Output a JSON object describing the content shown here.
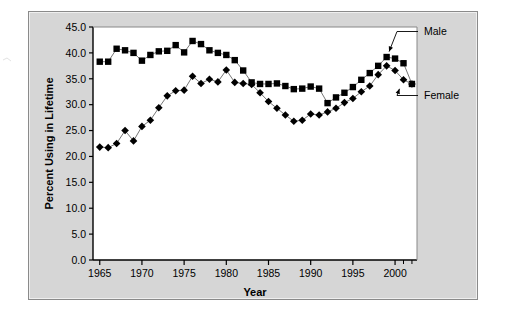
{
  "chart_data": {
    "type": "line",
    "title": "",
    "subtitle": "",
    "xlabel": "Year",
    "ylabel": "Percent Using in Lifetime",
    "xlim": [
      1964.2,
      2002.6
    ],
    "ylim": [
      0.0,
      45.0
    ],
    "yticks": [
      0.0,
      5.0,
      10.0,
      15.0,
      20.0,
      25.0,
      30.0,
      35.0,
      40.0,
      45.0
    ],
    "ytick_labels": [
      "0.0",
      "5.0",
      "10.0",
      "15.0",
      "20.0",
      "25.0",
      "30.0",
      "35.0",
      "40.0",
      "45.0"
    ],
    "xticks": [
      1965,
      1970,
      1975,
      1980,
      1985,
      1990,
      1995,
      2000
    ],
    "xtick_labels": [
      "1965",
      "1970",
      "1975",
      "1980",
      "1985",
      "1990",
      "1995",
      "2000"
    ],
    "x": [
      1965,
      1966,
      1967,
      1968,
      1969,
      1970,
      1971,
      1972,
      1973,
      1974,
      1975,
      1976,
      1977,
      1978,
      1979,
      1980,
      1981,
      1982,
      1983,
      1984,
      1985,
      1986,
      1987,
      1988,
      1989,
      1990,
      1991,
      1992,
      1993,
      1994,
      1995,
      1996,
      1997,
      1998,
      1999,
      2000,
      2001,
      2002
    ],
    "grid": false,
    "legend_position": "right-annotations",
    "series": [
      {
        "name": "Male",
        "marker": "filled-square",
        "color": "#000000",
        "line_color": "#777777",
        "values": [
          38.3,
          38.3,
          40.8,
          40.5,
          40.0,
          38.5,
          39.6,
          40.3,
          40.4,
          41.5,
          40.1,
          42.3,
          41.7,
          40.5,
          40.0,
          39.6,
          38.6,
          36.6,
          34.3,
          34.0,
          34.0,
          34.1,
          33.6,
          33.0,
          33.1,
          33.5,
          33.1,
          30.3,
          31.4,
          32.3,
          33.4,
          34.8,
          36.1,
          37.5,
          39.2,
          38.9,
          38.0,
          34.0
        ]
      },
      {
        "name": "Female",
        "marker": "filled-diamond",
        "color": "#000000",
        "line_color": "#777777",
        "values": [
          21.8,
          21.7,
          22.5,
          25.0,
          23.0,
          25.8,
          27.0,
          29.4,
          31.7,
          32.7,
          32.8,
          35.5,
          34.1,
          34.9,
          34.4,
          36.7,
          34.3,
          34.1,
          33.9,
          32.3,
          30.6,
          29.3,
          28.0,
          26.8,
          27.0,
          28.2,
          28.0,
          28.6,
          29.3,
          30.4,
          31.2,
          32.5,
          33.6,
          35.8,
          37.5,
          36.6,
          34.8,
          34.0
        ]
      }
    ],
    "annotations": [
      {
        "text": "Male",
        "points_to_series": "Male",
        "points_to_x": 2000
      },
      {
        "text": "Female",
        "points_to_series": "Female",
        "points_to_x": 2001
      }
    ]
  },
  "colors": {
    "panel_background": "#d6d6d6",
    "plot_background": "#ffffff",
    "axis": "#000000",
    "series_marker": "#000000",
    "series_line": "#777777"
  }
}
